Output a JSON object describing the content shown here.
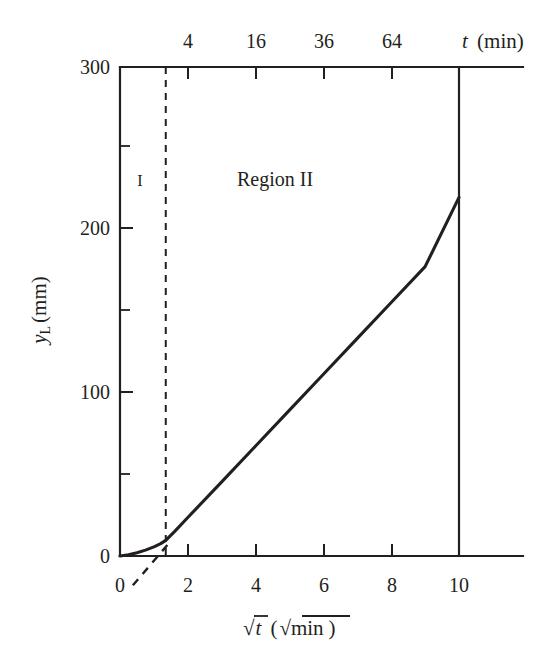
{
  "chart_data": {
    "type": "line",
    "title": "",
    "xlabel": "√t (√min)",
    "ylabel": "yL (mm)",
    "xlabel_parts": {
      "radical": "√",
      "variable": "t",
      "open_paren": "(",
      "unit_radical": "√",
      "unit": "min",
      "close_paren": ")"
    },
    "ylabel_parts": {
      "variable": "y",
      "subscript": "L",
      "unit": "(mm)"
    },
    "x_axis": {
      "name": "sqrt-t-axis",
      "position": "bottom",
      "ticks": [
        0,
        2,
        4,
        6,
        8,
        10
      ],
      "ticklabels": [
        "0",
        "2",
        "4",
        "6",
        "8",
        "10"
      ],
      "xlim": [
        0,
        10
      ],
      "minor_ticks": [
        1,
        3,
        5,
        7,
        9
      ]
    },
    "x_axis_top": {
      "name": "t-axis",
      "position": "top",
      "label": "t (min)",
      "label_parts": {
        "variable": "t",
        "unit": "(min)"
      },
      "ticks_sqrt": [
        2,
        4,
        6,
        8
      ],
      "ticklabels": [
        "4",
        "16",
        "36",
        "64"
      ]
    },
    "y_axis": {
      "name": "yL-axis",
      "ticks": [
        0,
        100,
        200,
        300
      ],
      "ticklabels": [
        "0",
        "100",
        "200",
        "300"
      ],
      "minor_ticks": [
        50,
        150,
        250
      ],
      "ylim": [
        0,
        300
      ]
    },
    "grid": false,
    "legend": false,
    "annotations": [
      {
        "name": "region-one-label",
        "text": "I",
        "x": 0.62,
        "y": 238
      },
      {
        "name": "region-two-label",
        "text": "Region  II",
        "x": 4.55,
        "y": 238
      }
    ],
    "region_divider": {
      "name": "region-divider",
      "x": 1.35,
      "style": "dashed"
    },
    "series": [
      {
        "name": "liquid-penetration-curve",
        "style": "solid",
        "points": [
          [
            0.0,
            0.0
          ],
          [
            0.25,
            0.8
          ],
          [
            0.5,
            2.0
          ],
          [
            0.75,
            3.6
          ],
          [
            1.0,
            5.6
          ],
          [
            1.2,
            7.6
          ],
          [
            1.35,
            9.6
          ],
          [
            1.6,
            14.8
          ],
          [
            2.0,
            23.6
          ],
          [
            3.0,
            45.5
          ],
          [
            4.0,
            67.5
          ],
          [
            5.0,
            89.5
          ],
          [
            6.0,
            111.5
          ],
          [
            7.0,
            133.5
          ],
          [
            8.0,
            155.5
          ],
          [
            9.0,
            177.5
          ],
          [
            10.0,
            220.0
          ]
        ]
      },
      {
        "name": "extrapolation-dashed-line",
        "style": "dashed",
        "points": [
          [
            0.38,
            -18.0
          ],
          [
            1.45,
            8.0
          ]
        ]
      }
    ],
    "colors": {
      "ink": "#231f20",
      "background": "#ffffff"
    }
  }
}
